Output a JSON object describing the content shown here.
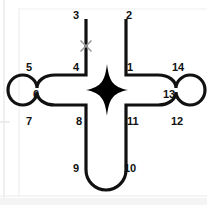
{
  "figure": {
    "stroke_color": "#111111",
    "fill_color": "#ffffff",
    "stroke_width": 3.2,
    "background_color": "#ffffff",
    "rule_color": "#e8e8e8",
    "marker_color": "#9a9a9a",
    "star_color": "#000000"
  },
  "labels": [
    {
      "id": "1",
      "text": "1",
      "x": 127,
      "y": 62
    },
    {
      "id": "2",
      "text": "2",
      "x": 126,
      "y": 10
    },
    {
      "id": "3",
      "text": "3",
      "x": 73,
      "y": 10
    },
    {
      "id": "4",
      "text": "4",
      "x": 73,
      "y": 62
    },
    {
      "id": "5",
      "text": "5",
      "x": 26,
      "y": 62
    },
    {
      "id": "6",
      "text": "6",
      "x": 33,
      "y": 89
    },
    {
      "id": "7",
      "text": "7",
      "x": 26,
      "y": 116
    },
    {
      "id": "8",
      "text": "8",
      "x": 76,
      "y": 116
    },
    {
      "id": "9",
      "text": "9",
      "x": 73,
      "y": 163
    },
    {
      "id": "10",
      "text": "10",
      "x": 124,
      "y": 163
    },
    {
      "id": "11",
      "text": "11",
      "x": 127,
      "y": 116
    },
    {
      "id": "12",
      "text": "12",
      "x": 171,
      "y": 116
    },
    {
      "id": "13",
      "text": "13",
      "x": 163,
      "y": 89
    },
    {
      "id": "14",
      "text": "14",
      "x": 172,
      "y": 62
    }
  ],
  "markers": {
    "cross_mark": {
      "name": "x-mark",
      "cx": 86,
      "cy": 46,
      "size": 11
    },
    "compass_star": {
      "name": "four-point-star",
      "cx": 107,
      "cy": 96,
      "radius_long": 30,
      "radius_short": 29
    }
  },
  "geometry": {
    "outline_path": "M 86 19 L 86 75 L 55 75 C 44 75 37 81 37 88 C 37 81 30 75 23 75 C 14 75 8 82 8 90 C 8 98 14 105 23 105 C 30 105 37 99 37 92 C 37 99 44 105 55 105 L 86 105 L 86 170 C 86 181 95 190 106 190 C 117 190 126 181 126 170 L 126 105 L 158 105 C 169 105 176 99 176 92 C 176 99 183 105 190 105 C 199 105 205 98 205 90 C 205 82 199 75 190 75 C 183 75 176 81 176 88 C 176 81 169 75 158 75 L 126 75 L 126 19",
    "star_path": "M 107 64 C 109 80 112 87 128 90 C 112 93 109 100 107 116 C 105 100 102 93 86 90 C 102 87 105 80 107 64 Z"
  },
  "rules": {
    "vertical_left_x": 4,
    "vertical_second_x": 19,
    "horizontal_top_y": 9,
    "horizontal_mid_y": 122,
    "horizontal_bottom_y": 196,
    "footer_band_y": 198
  }
}
